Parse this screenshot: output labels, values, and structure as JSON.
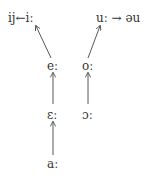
{
  "diagram": {
    "type": "vowel-shift",
    "nodes": {
      "ij_from_i": "ij←iː",
      "u_to_au": "uː → əu",
      "e_long": "eː",
      "o_long": "oː",
      "open_e_long": "ɛː",
      "open_o_long": "ɔː",
      "a_long": "aː"
    },
    "edges": [
      {
        "from": "eː",
        "to": "iː"
      },
      {
        "from": "oː",
        "to": "uː"
      },
      {
        "from": "ɛː",
        "to": "eː"
      },
      {
        "from": "ɔː",
        "to": "oː"
      },
      {
        "from": "aː",
        "to": "ɛː"
      },
      {
        "from": "iː",
        "to": "ij"
      },
      {
        "from": "uː",
        "to": "əu"
      }
    ],
    "colors": {
      "text": "#333333",
      "arrow": "#444444",
      "background": "#ffffff"
    }
  }
}
